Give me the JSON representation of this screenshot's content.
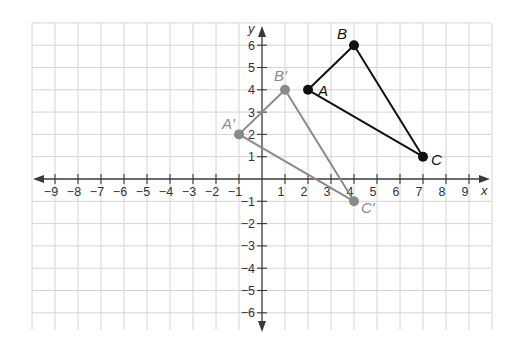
{
  "chart_data": {
    "type": "scatter",
    "title": "",
    "xlabel": "x",
    "ylabel": "y",
    "xlim": [
      -10,
      10
    ],
    "ylim": [
      -7,
      7
    ],
    "grid": true,
    "x_ticks": [
      -9,
      -8,
      -7,
      -6,
      -5,
      -4,
      -3,
      -2,
      -1,
      1,
      2,
      3,
      4,
      5,
      6,
      7,
      8,
      9
    ],
    "y_ticks": [
      6,
      5,
      4,
      3,
      2,
      1,
      -1,
      -2,
      -3,
      -4,
      -5,
      -6
    ],
    "x_tick_labels": [
      "−9",
      "−8",
      "−7",
      "−6",
      "−5",
      "−4",
      "−3",
      "−2",
      "−1",
      "1",
      "2",
      "3",
      "4",
      "5",
      "6",
      "7",
      "8",
      "9"
    ],
    "y_tick_labels": [
      "6",
      "5",
      "4",
      "3",
      "2",
      "1",
      "−1",
      "−2",
      "−3",
      "−4",
      "−5",
      "−6"
    ],
    "series": [
      {
        "name": "Triangle ABC",
        "color": "#111111",
        "points": [
          {
            "label": "A",
            "x": 2,
            "y": 4
          },
          {
            "label": "B",
            "x": 4,
            "y": 6
          },
          {
            "label": "C",
            "x": 7,
            "y": 1
          }
        ]
      },
      {
        "name": "Triangle A'B'C'",
        "color": "#8a8a8a",
        "points": [
          {
            "label": "A'",
            "x": -1,
            "y": 2
          },
          {
            "label": "B'",
            "x": 1,
            "y": 4
          },
          {
            "label": "C'",
            "x": 4,
            "y": -1
          }
        ]
      }
    ]
  }
}
